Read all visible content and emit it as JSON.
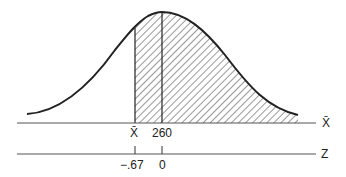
{
  "diagram": {
    "type": "normal-distribution-shaded",
    "xbar_axis": {
      "label": "X̄",
      "ticks": [
        {
          "label": "X̄",
          "position": "sample-mean"
        },
        {
          "label": "260",
          "position": "population-mean"
        }
      ]
    },
    "z_axis": {
      "label": "Z",
      "ticks": [
        {
          "label": "−.67"
        },
        {
          "label": "0"
        }
      ]
    },
    "shaded_region": "from X̄ (z = −.67) to right tail",
    "colors": {
      "ink": "#222222",
      "axis": "#555555",
      "background": "#ffffff"
    }
  }
}
